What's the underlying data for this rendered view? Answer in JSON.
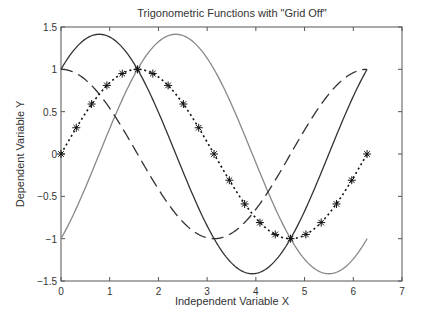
{
  "chart_data": {
    "type": "line",
    "title": "Trigonometric Functions with \"Grid Off\"",
    "xlabel": "Independent Variable X",
    "ylabel": "Dependent Variable Y",
    "xlim": [
      0,
      7
    ],
    "ylim": [
      -1.5,
      1.5
    ],
    "xticks": [
      "0",
      "1",
      "2",
      "3",
      "4",
      "5",
      "6",
      "7"
    ],
    "yticks": [
      "1.5",
      "1",
      "0.5",
      "0",
      "-0.5",
      "-1",
      "-1.5"
    ],
    "grid": false,
    "legend": null,
    "x_range": [
      0,
      6.2832
    ],
    "series": [
      {
        "name": "sin(x)",
        "style": "dotted",
        "marker": "asterisk",
        "color": "#111111",
        "x": [
          0,
          0.314,
          0.628,
          0.942,
          1.257,
          1.571,
          1.885,
          2.199,
          2.513,
          2.827,
          3.142,
          3.456,
          3.77,
          4.084,
          4.398,
          4.712,
          5.027,
          5.341,
          5.655,
          5.969,
          6.283
        ],
        "values": [
          0,
          0.31,
          0.59,
          0.81,
          0.95,
          1,
          0.95,
          0.81,
          0.59,
          0.31,
          0,
          -0.31,
          -0.59,
          -0.81,
          -0.95,
          -1,
          -0.95,
          -0.81,
          -0.59,
          -0.31,
          0
        ]
      },
      {
        "name": "cos(x)",
        "style": "dashed",
        "color": "#333333",
        "x": [
          0,
          0.785,
          1.571,
          2.356,
          3.142,
          3.927,
          4.712,
          5.498,
          6.283
        ],
        "values": [
          1,
          0.71,
          0,
          -0.71,
          -1,
          -0.71,
          0,
          0.71,
          1
        ]
      },
      {
        "name": "sin(x)+cos(x)",
        "style": "solid",
        "color": "#333333",
        "x": [
          0,
          0.785,
          1.571,
          2.356,
          3.142,
          3.927,
          4.712,
          5.498,
          6.283
        ],
        "values": [
          1,
          1.41,
          1,
          0,
          -1,
          -1.41,
          -1,
          0,
          1
        ]
      },
      {
        "name": "sin(x)-cos(x)",
        "style": "solid",
        "color": "#888888",
        "x": [
          0,
          0.785,
          1.571,
          2.356,
          3.142,
          3.927,
          4.712,
          5.498,
          6.283
        ],
        "values": [
          -1,
          0,
          1,
          1.41,
          1,
          0,
          -1,
          -1.41,
          -1
        ]
      }
    ]
  }
}
